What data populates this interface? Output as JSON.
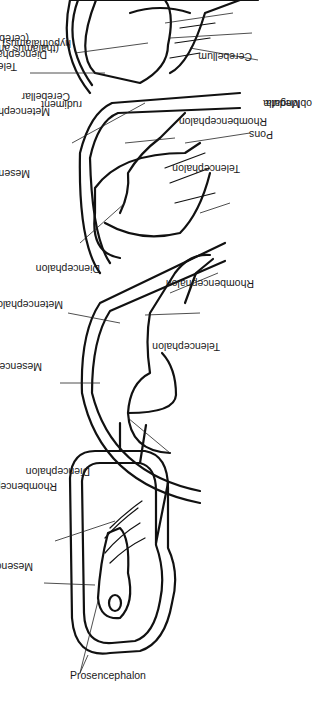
{
  "diagram": {
    "orientation": "rotated-90-ccw",
    "stages": [
      {
        "id": "stage-1",
        "labels": {
          "prosencephalon": "Prosencephalon",
          "mesencephalon": "Mesencephalon",
          "rhombencephalon": "Rhombencephalon"
        }
      },
      {
        "id": "stage-2",
        "labels": {
          "diencephalon": "Diencephalon",
          "mesencephalon": "Mesencephalon",
          "metencephalon": "Metencephalon",
          "telencephalon": "Telencephalon",
          "rhombencephalon": "Rhombencephalon"
        }
      },
      {
        "id": "stage-3",
        "labels": {
          "mesencephalon": "Mesencephalon",
          "metencephalon": "Metencephalon",
          "cerebellar_rudiment_1": "Cerebellar",
          "cerebellar_rudiment_2": "rudiment",
          "diencephalon": "Diencephalon",
          "telencephalon": "Telencephalon",
          "rhombencephalon": "Rhombencephalon"
        }
      },
      {
        "id": "stage-4",
        "labels": {
          "telencephalon_1": "Telencephalon",
          "telencephalon_2": "(cerebral hemispheres)",
          "diencephalon_1": "Diencephalon",
          "diencephalon_2": "(thalamus and",
          "diencephalon_3": "hypothalamus)",
          "cerebellum": "Cerebellum",
          "medulla_1": "Medulla",
          "medulla_2": "oblongata",
          "pons": "Pons"
        }
      }
    ]
  }
}
